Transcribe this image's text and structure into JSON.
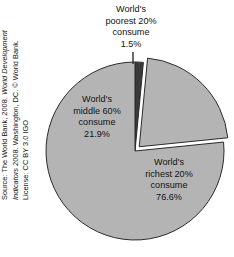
{
  "figure": {
    "background_color": "#ffffff"
  },
  "source": {
    "line1_prefix": "Source: The World Bank, 2008. ",
    "line1_italic": "World Development",
    "line2_italic": "Indicators",
    "line2_suffix": " 2008. Washington, DC. © World Bank.",
    "line3": "License: CC BY 3.0 IGO"
  },
  "labels": {
    "poorest": {
      "line1": "World's",
      "line2": "poorest 20%",
      "line3": "consume",
      "line4": "1.5%"
    },
    "middle": {
      "line1": "World's",
      "line2": "middle 60%",
      "line3": "consume",
      "line4": "21.9%"
    },
    "richest": {
      "line1": "World's",
      "line2": "richest 20%",
      "line3": "consume",
      "line4": "76.6%"
    }
  },
  "chart_data": {
    "type": "pie",
    "title": "",
    "subtitle": "",
    "xlabel": "",
    "ylabel": "",
    "legend_position": "none",
    "grid": false,
    "labels_on_slices": true,
    "start_angle_deg": 90,
    "direction": "clockwise",
    "center_px": [
      135,
      151
    ],
    "radius_px": 89,
    "categories": [
      "World's poorest 20% consume",
      "World's middle 60% consume",
      "World's richest 20% consume"
    ],
    "values": [
      1.5,
      21.9,
      76.6
    ],
    "value_labels": [
      "1.5%",
      "21.9%",
      "76.6%"
    ],
    "units": "percent of world consumption",
    "colors": [
      "#3a3a3a",
      "#b4b4b4",
      "#b4b4b4"
    ],
    "edge_color": "#2b2b2b",
    "exploded": [
      false,
      true,
      false
    ],
    "explode_offset_px": [
      0,
      6,
      0
    ],
    "annotations": [
      "World's poorest 20% consume 1.5%",
      "World's middle 60% consume 21.9%",
      "World's richest 20% consume 76.6%"
    ]
  }
}
